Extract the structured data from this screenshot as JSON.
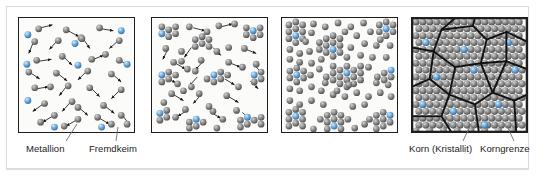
{
  "figure": {
    "panels": [
      {
        "id": "panel-1",
        "name": "schmelze-metallionen-fremdkeime",
        "stage_label": "Schmelze mit frei beweglichen Metallionen und Fremdkeimen",
        "atoms_gray": 34,
        "atoms_blue": 8,
        "arrows": 27,
        "clusters": 0
      },
      {
        "id": "panel-2",
        "name": "keimbildung",
        "stage_label": "Keimbildung an Fremdkeimen",
        "atoms_gray": 52,
        "atoms_blue": 8,
        "arrows": 20,
        "clusters": 9
      },
      {
        "id": "panel-3",
        "name": "kristallwachstum",
        "stage_label": "Wachstum der Kristallite",
        "atoms_gray": 96,
        "atoms_blue": 9,
        "arrows": 0,
        "clusters": 9
      },
      {
        "id": "panel-4",
        "name": "gefuege-korngrenzen",
        "stage_label": "Fertiges Gefuege mit Koernern und Korngrenzen",
        "atoms_gray": 215,
        "atoms_blue": 10,
        "arrows": 0,
        "grains": 9
      }
    ],
    "labels": {
      "metallion": "Metallion",
      "fremdkeim": "Fremdkeim",
      "korn": "Korn (Kristallit)",
      "korngrenze": "Korngrenze"
    },
    "colors": {
      "atom_gray": "#8a8a8a",
      "atom_gray_dark": "#5b5b5b",
      "atom_gray_light": "#c9c9c9",
      "atom_blue": "#6aa9dd",
      "atom_blue_dark": "#3d7cb4",
      "atom_blue_light": "#bcdcf4",
      "panel_border": "#1e1e1e",
      "panel_background": "#fbfbfa",
      "grain_boundary": "#111111",
      "leader_line": "#6d6d6d",
      "text": "#1b1b1b",
      "frame_border": "#d9dcdf",
      "page_background": "#ffffff"
    },
    "icon_names": {
      "metal_ion": "gray-sphere-icon",
      "foreign_nucleus": "blue-sphere-icon",
      "motion_arrow": "motion-arrow-icon",
      "grain_boundary": "grain-boundary-line-icon",
      "leader": "leader-line-icon"
    }
  }
}
